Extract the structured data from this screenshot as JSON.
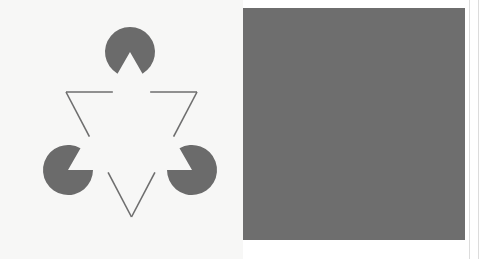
{
  "figure": {
    "canvas": {
      "width": 487,
      "height": 259
    },
    "colors": {
      "page_background": "#ffffff",
      "left_panel_background": "#f7f7f6",
      "left_inducer_fill": "#6b6b6b",
      "left_outline_stroke": "#6e6e6e",
      "right_panel_background": "#6e6e6e",
      "right_inducer_fill": "#f5f5f3",
      "right_outline_stroke": "#f5f5f3",
      "edge_rule": "#dcdcdc"
    },
    "panels": [
      {
        "id": "left-panel",
        "name": "light-panel",
        "rect": {
          "x": 0,
          "y": 0,
          "width": 243,
          "height": 259
        },
        "background": "#f7f7f6",
        "inducer_fill": "#6b6b6b",
        "outline_stroke": "#6e6e6e",
        "outline_stroke_width": 1.6,
        "figure_offset": {
          "x": 0,
          "y": 0
        }
      },
      {
        "id": "right-panel",
        "name": "dark-panel",
        "rect": {
          "x": 243,
          "y": 8,
          "width": 222,
          "height": 232
        },
        "background": "#6e6e6e",
        "inducer_fill": "#f5f5f3",
        "outline_stroke": "#f5f5f3",
        "outline_stroke_width": 1.8,
        "figure_offset": {
          "x": 251,
          "y": 0
        }
      }
    ],
    "geometry": {
      "inducers": [
        {
          "name": "inducer-top",
          "cx": 130,
          "cy": 52,
          "r": 25,
          "notch_half_angle_deg": 30,
          "notch_direction_deg": 90
        },
        {
          "name": "inducer-bottom-left",
          "cx": 68,
          "cy": 170,
          "r": 25,
          "notch_half_angle_deg": 30,
          "notch_direction_deg": 330
        },
        {
          "name": "inducer-bottom-right",
          "cx": 192,
          "cy": 170,
          "r": 25,
          "notch_half_angle_deg": 30,
          "notch_direction_deg": 210
        }
      ],
      "outline_triangle": {
        "name": "outlined-inverted-triangle",
        "orientation": "point-down",
        "vertices": [
          {
            "x": 66,
            "y": 92
          },
          {
            "x": 197,
            "y": 92
          },
          {
            "x": 131.5,
            "y": 217
          }
        ],
        "gap_fraction": 0.285
      },
      "illusory_triangle": {
        "name": "illusory-upright-triangle",
        "orientation": "point-up",
        "vertices": [
          {
            "x": 130,
            "y": 52
          },
          {
            "x": 68,
            "y": 170
          },
          {
            "x": 192,
            "y": 170
          }
        ]
      }
    },
    "edge_rules": [
      {
        "name": "right-inner-rule",
        "x": 469
      },
      {
        "name": "right-outer-rule",
        "x": 478
      }
    ]
  }
}
